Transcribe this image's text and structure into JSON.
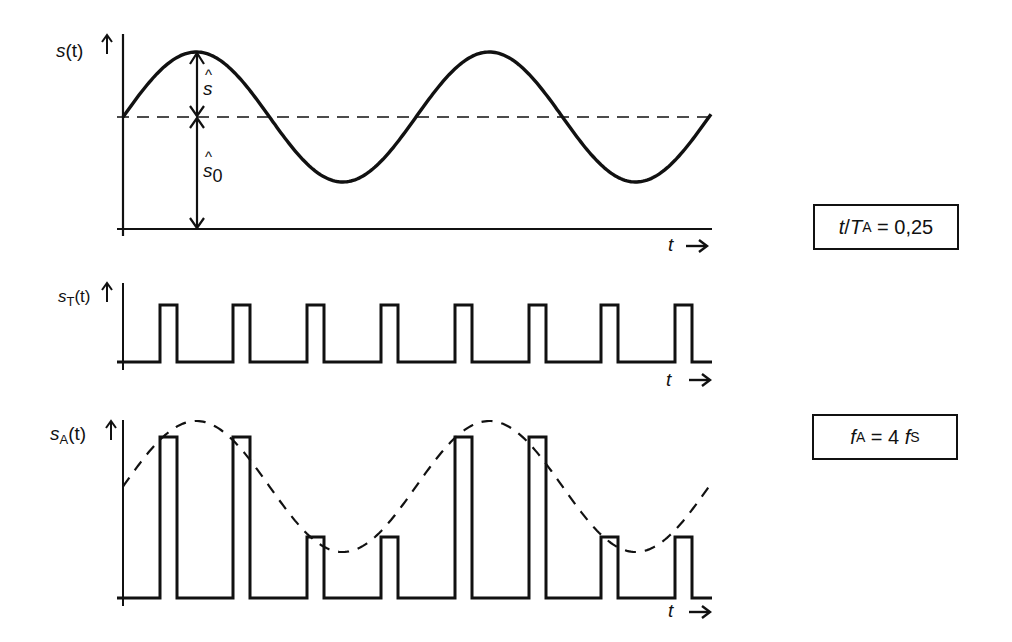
{
  "diagram": {
    "plots": [
      {
        "id": "signal",
        "ylabel": {
          "base": "s",
          "sub": "",
          "arg": "(t)"
        },
        "xlabel": "t",
        "annotations": [
          {
            "symbol": "ŝ",
            "meaning": "amplitude"
          },
          {
            "symbol": "ŝ",
            "sub": "0",
            "meaning": "offset (DC level)"
          }
        ],
        "periods_shown": 2,
        "style": "solid sine with dashed mean line"
      },
      {
        "id": "sampling_pulses",
        "ylabel": {
          "base": "s",
          "sub": "T",
          "arg": "(t)"
        },
        "xlabel": "t",
        "pulse_count": 8,
        "style": "rectangular pulse train"
      },
      {
        "id": "sampled_signal",
        "ylabel": {
          "base": "s",
          "sub": "A",
          "arg": "(t)"
        },
        "xlabel": "t",
        "pulse_count": 8,
        "pulse_levels": [
          "high",
          "high",
          "low",
          "low",
          "high",
          "high",
          "low",
          "low"
        ],
        "style": "pulses with dashed sine envelope"
      }
    ],
    "boxes": [
      {
        "id": "ratio",
        "var": "t",
        "sep": " / ",
        "var2": "T",
        "sub2": "A",
        "rest": " = 0,25"
      },
      {
        "id": "freq",
        "var": "f",
        "sub": "A",
        "mid": " = 4 ",
        "var2": "f",
        "sub2": "S"
      }
    ],
    "arrow_glyph": "→",
    "up_arrow_glyph": "↑"
  },
  "colors": {
    "ink": "#111111",
    "background": "#ffffff"
  }
}
